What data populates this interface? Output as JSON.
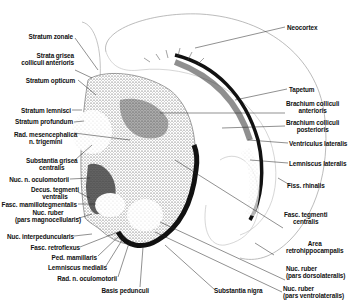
{
  "diagram": {
    "type": "anatomical cross-section, midbrain (coronal section)",
    "labels_left": [
      {
        "id": "stratum_zonale",
        "text": "Stratum zonale"
      },
      {
        "id": "strata_grisea_l1",
        "text": "Strata grisea"
      },
      {
        "id": "strata_grisea_l2",
        "text": "colliculi anterioris"
      },
      {
        "id": "stratum_opticum",
        "text": "Stratum opticum"
      },
      {
        "id": "stratum_lemnisci",
        "text": "Stratum lemnisci"
      },
      {
        "id": "stratum_profundum",
        "text": "Stratum profundum"
      },
      {
        "id": "rad_mes_l1",
        "text": "Rad. mesencephalica"
      },
      {
        "id": "rad_mes_l2",
        "text": "n. trigemini"
      },
      {
        "id": "subst_grisea_l1",
        "text": "Substantia grisea"
      },
      {
        "id": "subst_grisea_l2",
        "text": "centralis"
      },
      {
        "id": "nuc_oculomotorii",
        "text": "Nuc. n. oculomotorii"
      },
      {
        "id": "decus_l1",
        "text": "Decus. tegmenti"
      },
      {
        "id": "decus_l2",
        "text": "ventralis"
      },
      {
        "id": "fasc_mamillo",
        "text": "Fasc. mamillotegmentalis"
      },
      {
        "id": "nuc_ruber_mag_l1",
        "text": "Nuc. ruber"
      },
      {
        "id": "nuc_ruber_mag_l2",
        "text": "(pars magnocellularis)"
      },
      {
        "id": "nuc_interped",
        "text": "Nuc. interpeduncularis"
      },
      {
        "id": "fasc_retroflexus",
        "text": "Fasc. retroflexus"
      },
      {
        "id": "ped_mamillaris",
        "text": "Ped. mamillaris"
      },
      {
        "id": "lemniscus_medialis",
        "text": "Lemniscus medialis"
      },
      {
        "id": "rad_oculomotorii",
        "text": "Rad. n. oculomotorii"
      },
      {
        "id": "basis_pedunculi",
        "text": "Basis pedunculi"
      }
    ],
    "labels_right": [
      {
        "id": "neocortex",
        "text": "Neocortex"
      },
      {
        "id": "tapetum",
        "text": "Tapetum"
      },
      {
        "id": "brach_ant_l1",
        "text": "Brachium colliculi"
      },
      {
        "id": "brach_ant_l2",
        "text": "anterioris"
      },
      {
        "id": "brach_post_l1",
        "text": "Brachium colliculi"
      },
      {
        "id": "brach_post_l2",
        "text": "posterioris"
      },
      {
        "id": "ventriculus",
        "text": "Ventriculus lateralis"
      },
      {
        "id": "lemniscus_lat",
        "text": "Lemniscus lateralis"
      },
      {
        "id": "fiss_rhinalis",
        "text": "Fiss. rhinalis"
      },
      {
        "id": "fasc_tegm_l1",
        "text": "Fasc. tegmenti"
      },
      {
        "id": "fasc_tegm_l2",
        "text": "centralis"
      },
      {
        "id": "area_l1",
        "text": "Area"
      },
      {
        "id": "area_l2",
        "text": "retrohippocampalis"
      },
      {
        "id": "nuc_ruber_dl_l1",
        "text": "Nuc. ruber"
      },
      {
        "id": "nuc_ruber_dl_l2",
        "text": "(pars dorsolateralis)"
      },
      {
        "id": "nuc_ruber_vl_l1",
        "text": "Nuc. ruber"
      },
      {
        "id": "nuc_ruber_vl_l2",
        "text": "(pars ventrolateralis)"
      },
      {
        "id": "substantia_nigra",
        "text": "Substantia nigra"
      }
    ]
  }
}
